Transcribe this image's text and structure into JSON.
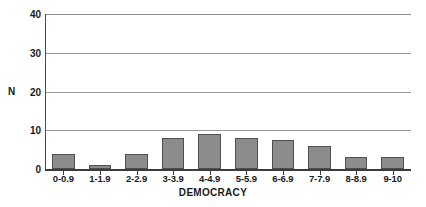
{
  "chart_data": {
    "type": "bar",
    "title": "",
    "subtitle": "",
    "xlabel": "DEMOCRACY",
    "ylabel": "N",
    "categories": [
      "0-0.9",
      "1-1.9",
      "2-2.9",
      "3-3.9",
      "4-4.9",
      "5-5.9",
      "6-6.9",
      "7-7.9",
      "8-8.9",
      "9-10"
    ],
    "values": [
      4,
      1,
      4,
      8,
      9,
      8,
      7.5,
      6,
      3,
      3
    ],
    "ylim": [
      0,
      40
    ],
    "yticks": [
      0,
      10,
      20,
      30,
      40
    ],
    "ytick_labels": [
      "0",
      "10",
      "20",
      "30",
      "40"
    ],
    "grid": true,
    "grid_axis": "y",
    "legend": false,
    "legend_position": "none",
    "bar_color": "#8c8c8c",
    "bar_edge_color": "#4f4f4f",
    "gridline_color": "#999999",
    "axis_color": "#3c3c3c",
    "background_color": "#ffffff",
    "text_color": "#1a1a1a"
  }
}
